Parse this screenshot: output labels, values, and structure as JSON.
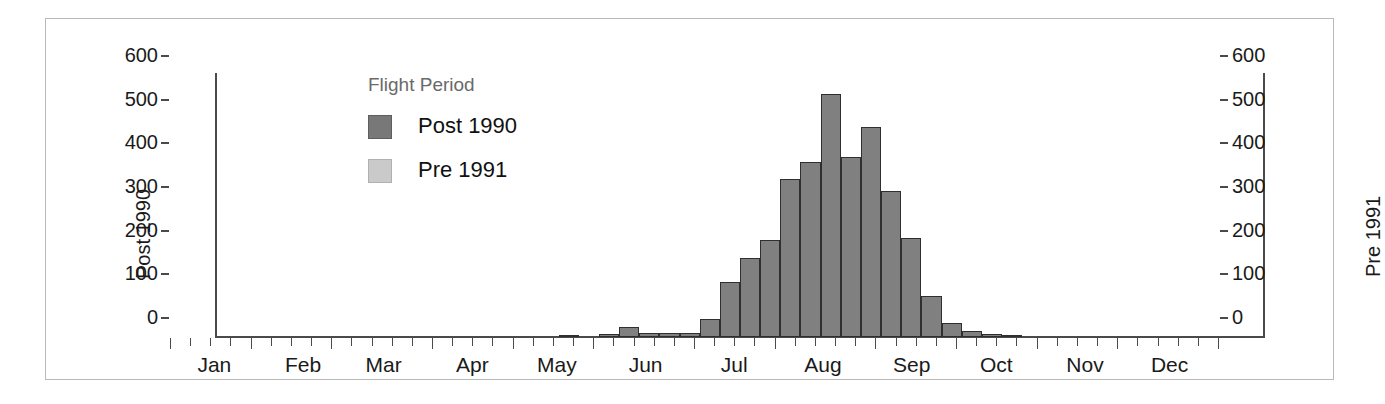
{
  "chart_data": {
    "type": "bar",
    "title": "",
    "subtitle": "",
    "xlabel": "",
    "ylabel": "Post 1990",
    "y2label": "Pre 1991",
    "ylim": [
      0,
      600
    ],
    "y2lim": [
      0,
      600
    ],
    "yticks": [
      0,
      100,
      200,
      300,
      400,
      500,
      600
    ],
    "ytick_labels": [
      "0",
      "100",
      "200",
      "300",
      "400",
      "500",
      "600"
    ],
    "y2ticks": [
      0,
      100,
      200,
      300,
      400,
      500,
      600
    ],
    "y2tick_labels": [
      "0",
      "100",
      "200",
      "300",
      "400",
      "500",
      "600"
    ],
    "grid": false,
    "legend": {
      "title": "Flight Period",
      "position": "upper-left-inside",
      "entries": [
        {
          "label": "Post 1990",
          "color": "#787878"
        },
        {
          "label": "Pre 1991",
          "color": "#cacaca"
        }
      ]
    },
    "x_axis_type": "time-of-year-weekly-bins",
    "month_labels": [
      "Jan",
      "Feb",
      "Mar",
      "Apr",
      "May",
      "Jun",
      "Jul",
      "Aug",
      "Sep",
      "Oct",
      "Nov",
      "Dec"
    ],
    "month_label_centers_week": [
      2.2,
      6.6,
      10.6,
      15.0,
      19.2,
      23.6,
      28.0,
      32.4,
      36.8,
      41.0,
      45.4,
      49.6
    ],
    "n_bins": 52,
    "bin_unit": "week",
    "series": [
      {
        "name": "Post 1990",
        "color": "#808080",
        "bins": [
          {
            "week": 1,
            "value": 0
          },
          {
            "week": 2,
            "value": 0
          },
          {
            "week": 3,
            "value": 0
          },
          {
            "week": 4,
            "value": 0
          },
          {
            "week": 5,
            "value": 0
          },
          {
            "week": 6,
            "value": 0
          },
          {
            "week": 7,
            "value": 0
          },
          {
            "week": 8,
            "value": 0
          },
          {
            "week": 9,
            "value": 0
          },
          {
            "week": 10,
            "value": 0
          },
          {
            "week": 11,
            "value": 0
          },
          {
            "week": 12,
            "value": 0
          },
          {
            "week": 13,
            "value": 0
          },
          {
            "week": 14,
            "value": 0
          },
          {
            "week": 15,
            "value": 0
          },
          {
            "week": 16,
            "value": 0
          },
          {
            "week": 17,
            "value": 0
          },
          {
            "week": 18,
            "value": 5
          },
          {
            "week": 19,
            "value": 0
          },
          {
            "week": 20,
            "value": 6
          },
          {
            "week": 21,
            "value": 22
          },
          {
            "week": 22,
            "value": 9
          },
          {
            "week": 23,
            "value": 10
          },
          {
            "week": 24,
            "value": 10
          },
          {
            "week": 25,
            "value": 42
          },
          {
            "week": 26,
            "value": 125
          },
          {
            "week": 27,
            "value": 182
          },
          {
            "week": 28,
            "value": 222
          },
          {
            "week": 29,
            "value": 363
          },
          {
            "week": 30,
            "value": 400
          },
          {
            "week": 31,
            "value": 557
          },
          {
            "week": 32,
            "value": 413
          },
          {
            "week": 33,
            "value": 480
          },
          {
            "week": 34,
            "value": 334
          },
          {
            "week": 35,
            "value": 227
          },
          {
            "week": 36,
            "value": 93
          },
          {
            "week": 37,
            "value": 33
          },
          {
            "week": 38,
            "value": 13
          },
          {
            "week": 39,
            "value": 6
          },
          {
            "week": 40,
            "value": 3
          },
          {
            "week": 41,
            "value": 0
          },
          {
            "week": 42,
            "value": 0
          },
          {
            "week": 43,
            "value": 0
          },
          {
            "week": 44,
            "value": 0
          },
          {
            "week": 45,
            "value": 0
          },
          {
            "week": 46,
            "value": 0
          },
          {
            "week": 47,
            "value": 0
          },
          {
            "week": 48,
            "value": 0
          },
          {
            "week": 49,
            "value": 0
          },
          {
            "week": 50,
            "value": 0
          },
          {
            "week": 51,
            "value": 0
          },
          {
            "week": 52,
            "value": 0
          }
        ]
      },
      {
        "name": "Pre 1991",
        "color": "#cacaca",
        "bins": []
      }
    ]
  }
}
